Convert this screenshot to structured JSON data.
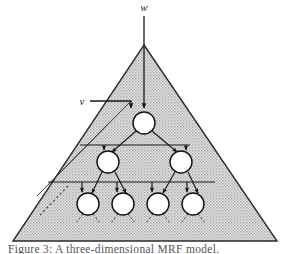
{
  "figure": {
    "caption": "Figure 3: A three-dimensional MRF model.",
    "labels": {
      "w": "w",
      "v": "v"
    },
    "colors": {
      "shade_fill": "#c9c9c9",
      "outline": "#1a1a1a",
      "node_fill": "#ffffff",
      "node_stroke": "#111111",
      "background": "#ffffff",
      "caption_text": "#55545a"
    },
    "shape": {
      "type": "triangle",
      "apex": [
        144,
        45
      ],
      "base_left": [
        13,
        241
      ],
      "base_right": [
        277,
        241
      ],
      "fill_pattern": "stipple-hatch"
    },
    "levels": [
      {
        "index": 0,
        "name": "root-level",
        "node_radius": 11,
        "nodes": [
          {
            "id": "n0",
            "cx": 144,
            "cy": 123
          }
        ]
      },
      {
        "index": 1,
        "name": "second-level",
        "node_radius": 11,
        "nodes": [
          {
            "id": "n1",
            "cx": 108,
            "cy": 162
          },
          {
            "id": "n2",
            "cx": 181,
            "cy": 162
          }
        ]
      },
      {
        "index": 2,
        "name": "third-level",
        "node_radius": 11,
        "nodes": [
          {
            "id": "n3",
            "cx": 88,
            "cy": 204
          },
          {
            "id": "n4",
            "cx": 123,
            "cy": 204
          },
          {
            "id": "n5",
            "cx": 158,
            "cy": 204
          },
          {
            "id": "n6",
            "cx": 193,
            "cy": 204
          }
        ]
      }
    ],
    "connector_bars": [
      {
        "id": "bar-level1",
        "y": 145,
        "x1": 80,
        "x2": 190
      },
      {
        "id": "bar-level2",
        "y": 182,
        "x1": 48,
        "x2": 215
      }
    ],
    "input_arrows": [
      {
        "id": "w-arrow",
        "label": "w",
        "x": 144,
        "y_from": 14,
        "y_to": 111,
        "label_x": 144,
        "label_y": 11
      },
      {
        "id": "v-arrow",
        "label": "v",
        "x_from": 92,
        "x_to": 131,
        "y": 101,
        "down_to": 111,
        "label_x": 82,
        "label_y": 105
      }
    ]
  }
}
